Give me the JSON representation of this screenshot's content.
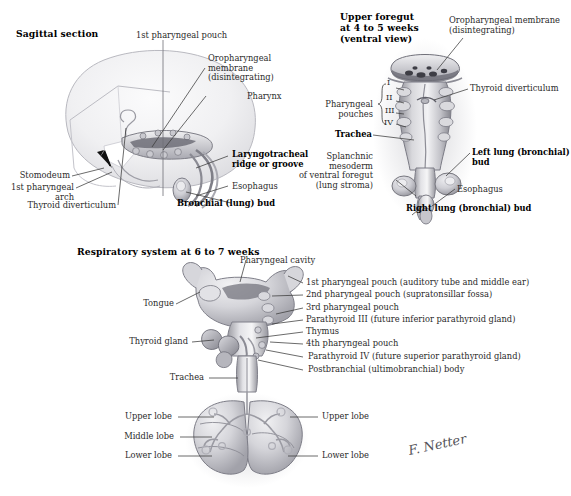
{
  "figure": {
    "style": "grayscale medical illustration",
    "signature": "F. Netter",
    "colors": {
      "background": "#ffffff",
      "ink": "#2b2b2b",
      "bold_ink": "#000000",
      "leader_line": "#3a3a3a",
      "tissue_light": "#e9e9ec",
      "tissue_mid": "#c3c3c8",
      "tissue_dark": "#8d8d94",
      "tissue_shadow": "#6a6a72"
    }
  },
  "panels": {
    "sagittal": {
      "title": "Sagittal section",
      "labels": [
        {
          "id": "first-pharyngeal-pouch",
          "text": "1st pharyngeal pouch",
          "bold": false
        },
        {
          "id": "oropharyngeal-membrane",
          "text": "Oropharyngeal\nmembrane\n(disintegrating)",
          "bold": false
        },
        {
          "id": "pharynx",
          "text": "Pharynx",
          "bold": false
        },
        {
          "id": "laryngotracheal-ridge",
          "text": "Laryngotracheal\nridge or groove",
          "bold": true
        },
        {
          "id": "esophagus",
          "text": "Esophagus",
          "bold": false
        },
        {
          "id": "bronchial-lung-bud",
          "text": "Bronchial (lung) bud",
          "bold": true
        },
        {
          "id": "stomodeum",
          "text": "Stomodeum",
          "bold": false
        },
        {
          "id": "first-pharyngeal-arch",
          "text": "1st pharyngeal arch",
          "bold": false
        },
        {
          "id": "thyroid-diverticulum",
          "text": "Thyroid diverticulum",
          "bold": false
        }
      ]
    },
    "upper_foregut": {
      "title": "Upper foregut\nat 4 to 5 weeks\n(ventral view)",
      "labels": [
        {
          "id": "oropharyngeal-membrane",
          "text": "Oropharyngeal membrane\n(disintegrating)",
          "bold": false
        },
        {
          "id": "thyroid-diverticulum",
          "text": "Thyroid diverticulum",
          "bold": false
        },
        {
          "id": "pharyngeal-pouches",
          "text": "Pharyngeal pouches",
          "bold": false
        },
        {
          "id": "trachea",
          "text": "Trachea",
          "bold": true
        },
        {
          "id": "left-lung-bud",
          "text": "Left lung (bronchial) bud",
          "bold": true
        },
        {
          "id": "splanchnic-mesoderm",
          "text": "Splanchnic mesoderm\nof ventral foregut\n(lung stroma)",
          "bold": false
        },
        {
          "id": "esophagus",
          "text": "Esophagus",
          "bold": false
        },
        {
          "id": "right-lung-bud",
          "text": "Right lung (bronchial) bud",
          "bold": true
        }
      ],
      "pouch_numerals": [
        "I",
        "II",
        "III",
        "IV"
      ]
    },
    "respiratory_system": {
      "title": "Respiratory system at 6 to 7 weeks",
      "labels": [
        {
          "id": "pharyngeal-cavity",
          "text": "Pharyngeal cavity",
          "bold": false
        },
        {
          "id": "first-pharyngeal-pouch",
          "text": "1st pharyngeal pouch (auditory tube and middle ear)",
          "bold": false
        },
        {
          "id": "second-pharyngeal-pouch",
          "text": "2nd pharyngeal pouch (supratonsillar fossa)",
          "bold": false
        },
        {
          "id": "third-pharyngeal-pouch",
          "text": "3rd pharyngeal pouch",
          "bold": false
        },
        {
          "id": "parathyroid-iii",
          "text": "Parathyroid III (future inferior parathyroid gland)",
          "bold": false
        },
        {
          "id": "thymus",
          "text": "Thymus",
          "bold": false
        },
        {
          "id": "fourth-pharyngeal-pouch",
          "text": "4th pharyngeal pouch",
          "bold": false
        },
        {
          "id": "parathyroid-iv",
          "text": "Parathyroid IV (future superior parathyroid gland)",
          "bold": false
        },
        {
          "id": "postbranchial-body",
          "text": "Postbranchial (ultimobranchial) body",
          "bold": false
        },
        {
          "id": "tongue",
          "text": "Tongue",
          "bold": false
        },
        {
          "id": "thyroid-gland",
          "text": "Thyroid gland",
          "bold": false
        },
        {
          "id": "trachea",
          "text": "Trachea",
          "bold": false
        },
        {
          "id": "upper-lobe-left",
          "text": "Upper lobe",
          "bold": false
        },
        {
          "id": "middle-lobe-left",
          "text": "Middle lobe",
          "bold": false
        },
        {
          "id": "lower-lobe-left",
          "text": "Lower lobe",
          "bold": false
        },
        {
          "id": "upper-lobe-right",
          "text": "Upper lobe",
          "bold": false
        },
        {
          "id": "lower-lobe-right",
          "text": "Lower lobe",
          "bold": false
        }
      ]
    }
  }
}
